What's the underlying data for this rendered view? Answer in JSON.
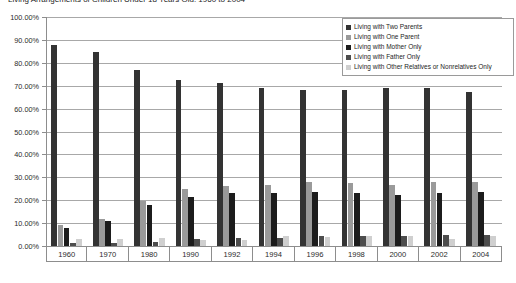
{
  "chart_data": {
    "type": "bar",
    "title": "Living Arrangements of Children Under 18 Years Old: 1960 to 2004",
    "xlabel": "",
    "ylabel": "",
    "ylim": [
      0,
      100
    ],
    "ytick_step": 10,
    "grid": true,
    "legend_position": "top-right",
    "categories": [
      "1960",
      "1970",
      "1980",
      "1990",
      "1992",
      "1994",
      "1996",
      "1998",
      "2000",
      "2002",
      "2004"
    ],
    "ytick_labels": [
      "100.00%",
      "90.00%",
      "80.00%",
      "70.00%",
      "60.00%",
      "50.00%",
      "40.00%",
      "30.00%",
      "20.00%",
      "10.00%",
      "0.00%"
    ],
    "series": [
      {
        "name": "Living with Two Parents",
        "color": "#333333",
        "values": [
          87.7,
          84.9,
          76.7,
          72.5,
          71.0,
          69.0,
          68.0,
          68.1,
          69.1,
          69.2,
          67.4
        ]
      },
      {
        "name": "Living with One Parent",
        "color": "#9a9a9a",
        "values": [
          9.1,
          11.9,
          19.7,
          24.7,
          26.3,
          26.7,
          28.1,
          27.7,
          26.7,
          27.8,
          28.1
        ]
      },
      {
        "name": "Living with Mother Only",
        "color": "#1c1c1c",
        "values": [
          8.0,
          10.8,
          18.0,
          21.6,
          23.0,
          23.3,
          23.7,
          23.3,
          22.4,
          23.0,
          23.4
        ]
      },
      {
        "name": "Living with Father Only",
        "color": "#4d4d4d",
        "values": [
          1.1,
          1.1,
          1.7,
          3.1,
          3.3,
          3.4,
          4.4,
          4.4,
          4.2,
          4.8,
          4.6
        ]
      },
      {
        "name": "Living with Other Relatives or Nonrelatives Only",
        "color": "#cfcfcf",
        "values": [
          3.2,
          3.2,
          3.7,
          2.8,
          2.7,
          4.3,
          3.9,
          4.2,
          4.2,
          3.0,
          4.5
        ]
      }
    ]
  },
  "legend": {
    "items": [
      "Living with Two Parents",
      "Living with One Parent",
      "Living with Mother Only",
      "Living with Father Only",
      "Living with Other Relatives or Nonrelatives Only"
    ]
  }
}
